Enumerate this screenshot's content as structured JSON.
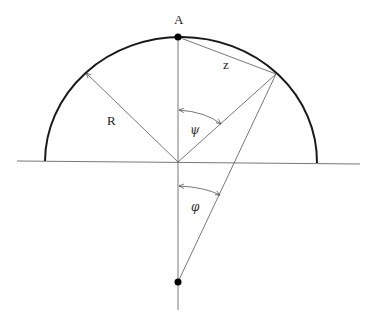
{
  "figure": {
    "type": "geometric diagram"
  },
  "labels": {
    "point_a": "A",
    "chord": "z",
    "radius": "R",
    "central_angle": "ψ",
    "external_angle": "φ"
  },
  "colors": {
    "stroke_thick": "#1a1a1a",
    "stroke_thin": "#555555",
    "point_fill": "#000000",
    "background": "#ffffff"
  },
  "geometry": {
    "center": [
      179,
      162
    ],
    "point_a": [
      178,
      37
    ],
    "point_on_circle": [
      276,
      74
    ],
    "radius_arrow_tip": [
      86,
      73
    ],
    "external_point": [
      178,
      282
    ],
    "baseline": [
      [
        17,
        161
      ],
      [
        360,
        164
      ]
    ],
    "semicircle_ends": [
      [
        45,
        161
      ],
      [
        317,
        163
      ]
    ]
  }
}
